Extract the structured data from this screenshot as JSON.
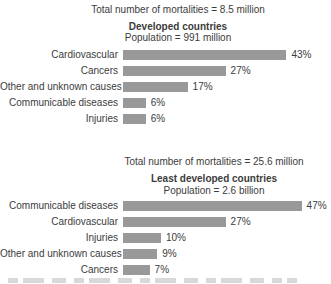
{
  "colors": {
    "bar": "#999999",
    "text": "#3c3c3c",
    "background": "#ffffff"
  },
  "chart_data": [
    {
      "type": "bar",
      "orientation": "horizontal",
      "annotation": "Total number of mortalities = 8.5 million",
      "title": "Developed countries",
      "subtitle": "Population = 991 million",
      "categories": [
        "Cardiovascular",
        "Cancers",
        "Other and unknown causes",
        "Communicable diseases",
        "Injuries"
      ],
      "values": [
        43,
        27,
        17,
        6,
        6
      ],
      "value_labels": [
        "43%",
        "27%",
        "17%",
        "6%",
        "6%"
      ],
      "unit": "%",
      "xlim": [
        0,
        50
      ],
      "grid": false,
      "legend": "none"
    },
    {
      "type": "bar",
      "orientation": "horizontal",
      "annotation": "Total number of mortalities = 25.6 million",
      "title": "Least developed countries",
      "subtitle": "Population = 2.6 billion",
      "categories": [
        "Communicable diseases",
        "Cardiovascular",
        "Injuries",
        "Other and unknown causes",
        "Cancers"
      ],
      "values": [
        47,
        27,
        10,
        9,
        7
      ],
      "value_labels": [
        "47%",
        "27%",
        "10%",
        "9%",
        "7%"
      ],
      "unit": "%",
      "xlim": [
        0,
        50
      ],
      "grid": false,
      "legend": "none"
    }
  ]
}
